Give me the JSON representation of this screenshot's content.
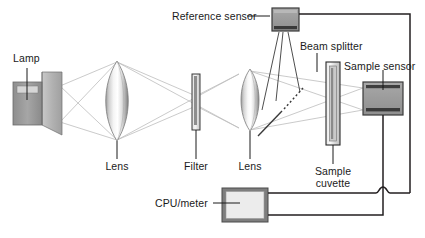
{
  "diagram": {
    "background_color": "#ffffff",
    "labels": {
      "lamp": "Lamp",
      "lens1": "Lens",
      "filter": "Filter",
      "lens2": "Lens",
      "reference_sensor": "Reference sensor",
      "beam_splitter": "Beam splitter",
      "sample_sensor": "Sample sensor",
      "sample_cuvette_line1": "Sample",
      "sample_cuvette_line2": "cuvette",
      "cpu_meter": "CPU/meter"
    },
    "components": [
      {
        "name": "lamp",
        "label": "Lamp",
        "type": "light-source"
      },
      {
        "name": "lens1",
        "label": "Lens",
        "type": "biconvex-lens"
      },
      {
        "name": "filter",
        "label": "Filter",
        "type": "optical-filter"
      },
      {
        "name": "lens2",
        "label": "Lens",
        "type": "biconvex-lens"
      },
      {
        "name": "beam-splitter",
        "label": "Beam splitter",
        "type": "beam-splitter"
      },
      {
        "name": "reference-sensor",
        "label": "Reference sensor",
        "type": "detector"
      },
      {
        "name": "sample-cuvette",
        "label": "Sample cuvette",
        "type": "cuvette"
      },
      {
        "name": "sample-sensor",
        "label": "Sample sensor",
        "type": "detector"
      },
      {
        "name": "cpu-meter",
        "label": "CPU/meter",
        "type": "electronics"
      }
    ],
    "colors": {
      "stroke_dark": "#231f20",
      "stroke_ray": "#b9b9b9",
      "sensor_fill": "#9b9b9b",
      "sensor_border": "#4a4a4a",
      "sensor_bar": "#3a3a3a",
      "lamp_body": "#9e9e9e",
      "lamp_cone": "#b5b5b5",
      "cpu_fill": "#e9e9e9",
      "cpu_border": "#6e6e6e",
      "lens_light": "#ffffff",
      "lens_dark": "#8d8d8d",
      "text": "#1a1a1a"
    }
  }
}
